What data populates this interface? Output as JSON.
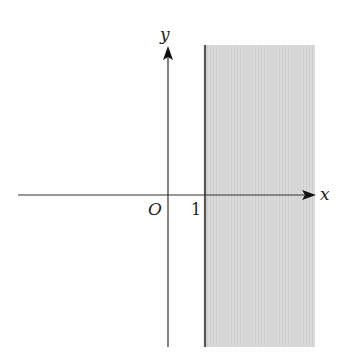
{
  "diagram": {
    "axes": {
      "x_label": "x",
      "y_label": "y",
      "origin_label": "O"
    },
    "ticks": {
      "x_tick_label": "1"
    },
    "boundary": {
      "equation": "x = 1",
      "style": "solid"
    },
    "shaded_region": {
      "inequality": "x >= 1",
      "color": "#d6d6d6"
    },
    "colors": {
      "axis": "#333333",
      "boundary": "#555555",
      "shade": "#d6d6d6"
    }
  }
}
